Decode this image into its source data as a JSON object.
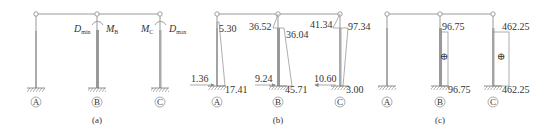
{
  "figure": {
    "panels": [
      {
        "caption": "(a)",
        "columns": [
          {
            "label": "A"
          },
          {
            "label": "B",
            "left_label_main": "D",
            "left_label_sub": "min",
            "right_label_main": "M",
            "right_label_sub": "B"
          },
          {
            "label": "C",
            "left_label_main": "M",
            "left_label_sub": "C",
            "right_label_main": "D",
            "right_label_sub": "max"
          }
        ]
      },
      {
        "caption": "(b)",
        "description": "Bending moment diagram",
        "columns": [
          {
            "label": "A",
            "top_value": "5.30",
            "bottom_value": "17.41",
            "shear_value": "1.36",
            "shear_direction": "right"
          },
          {
            "label": "B",
            "top_left_value": "36.52",
            "top_right_value": "36.04",
            "bottom_value": "45.71",
            "shear_value": "9.24",
            "shear_direction": "right"
          },
          {
            "label": "C",
            "top_left_value": "41.34",
            "top_right_value": "97.34",
            "bottom_value": "3.00",
            "shear_value": "10.60",
            "shear_direction": "left"
          }
        ]
      },
      {
        "caption": "(c)",
        "description": "Axial force diagram",
        "columns": [
          {
            "label": "A"
          },
          {
            "label": "B",
            "top_value": "96.75",
            "bottom_value": "96.75",
            "sign": "⊕"
          },
          {
            "label": "C",
            "top_value": "462.25",
            "bottom_value": "462.25",
            "sign": "⊕"
          }
        ]
      }
    ],
    "colors": {
      "line": "#999999",
      "column": "#aaaaaa",
      "text": "#333333"
    }
  }
}
